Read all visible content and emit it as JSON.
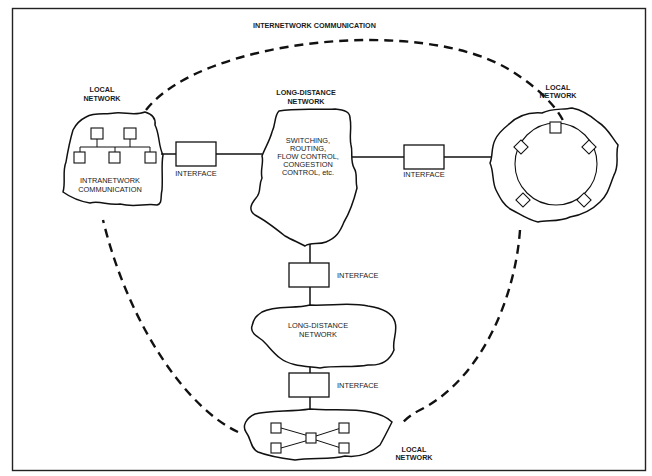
{
  "diagram": {
    "title": "INTERNETWORK COMMUNICATION",
    "networks": [
      {
        "id": "local-left",
        "label_lines": [
          "LOCAL",
          "NETWORK"
        ],
        "inner_lines": [
          "INTRANETWORK",
          "COMMUNICATION"
        ],
        "topology": "bus",
        "node_count": 5
      },
      {
        "id": "long-distance-top",
        "label_lines": [
          "LONG-DISTANCE",
          "NETWORK"
        ],
        "inner_lines": [
          "SWITCHING,",
          "ROUTING,",
          "FLOW CONTROL,",
          "CONGESTION",
          "CONTROL, etc."
        ]
      },
      {
        "id": "local-right",
        "label_lines": [
          "LOCAL",
          "NETWORK"
        ],
        "topology": "ring",
        "node_count": 5
      },
      {
        "id": "long-distance-middle",
        "inner_lines": [
          "LONG-DISTANCE",
          "NETWORK"
        ]
      },
      {
        "id": "local-bottom",
        "label_lines": [
          "LOCAL",
          "NETWORK"
        ],
        "topology": "star",
        "node_count": 5
      }
    ],
    "interfaces": [
      {
        "id": "interface-left",
        "label": "INTERFACE"
      },
      {
        "id": "interface-right",
        "label": "INTERFACE"
      },
      {
        "id": "interface-upper-vertical",
        "label": "INTERFACE"
      },
      {
        "id": "interface-lower-vertical",
        "label": "INTERFACE"
      }
    ],
    "connections": [
      [
        "local-left",
        "interface-left",
        "long-distance-top"
      ],
      [
        "long-distance-top",
        "interface-right",
        "local-right"
      ],
      [
        "long-distance-top",
        "interface-upper-vertical",
        "long-distance-middle"
      ],
      [
        "long-distance-middle",
        "interface-lower-vertical",
        "local-bottom"
      ]
    ],
    "colors": {
      "ink": "#111111",
      "background": "#ffffff"
    }
  }
}
